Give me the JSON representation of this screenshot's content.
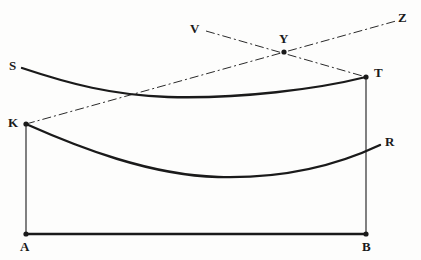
{
  "figure": {
    "type": "geometric-diagram",
    "background_color": "#fdfdfc",
    "stroke_color": "#1a1a1a",
    "width": 421,
    "height": 260,
    "labels": [
      {
        "id": "S",
        "text": "S",
        "x": 9,
        "y": 59,
        "name": "vertex-label-s"
      },
      {
        "id": "K",
        "text": "K",
        "x": 8,
        "y": 116,
        "name": "vertex-label-k"
      },
      {
        "id": "A",
        "text": "A",
        "x": 20,
        "y": 240,
        "name": "vertex-label-a"
      },
      {
        "id": "B",
        "text": "B",
        "x": 362,
        "y": 240,
        "name": "vertex-label-b"
      },
      {
        "id": "T",
        "text": "T",
        "x": 374,
        "y": 66,
        "name": "vertex-label-t"
      },
      {
        "id": "R",
        "text": "R",
        "x": 385,
        "y": 135,
        "name": "vertex-label-r"
      },
      {
        "id": "V",
        "text": "V",
        "x": 190,
        "y": 22,
        "name": "vertex-label-v"
      },
      {
        "id": "Y",
        "text": "Y",
        "x": 279,
        "y": 32,
        "name": "vertex-label-y"
      },
      {
        "id": "Z",
        "text": "Z",
        "x": 398,
        "y": 11,
        "name": "vertex-label-z"
      }
    ],
    "points": [
      {
        "id": "A",
        "x": 26,
        "y": 234
      },
      {
        "id": "B",
        "x": 366,
        "y": 234
      },
      {
        "id": "K",
        "x": 26,
        "y": 124
      },
      {
        "id": "T",
        "x": 366,
        "y": 77
      },
      {
        "id": "Y",
        "x": 284,
        "y": 52
      }
    ],
    "segments": [
      {
        "id": "AB",
        "name": "segment-ab",
        "from": "A",
        "to": "B",
        "style": "solid",
        "width": 2.4
      },
      {
        "id": "AK",
        "name": "segment-ak",
        "from": "A",
        "to": "K",
        "style": "solid",
        "width": 1.1
      },
      {
        "id": "BT",
        "name": "segment-bt",
        "from": "B",
        "to": "T",
        "style": "solid",
        "width": 1.1
      }
    ],
    "curves": [
      {
        "id": "ST",
        "name": "curve-st",
        "from": "S",
        "to": "T",
        "style": "solid",
        "width": 2.3,
        "path": "M 22 68 C 70 84, 112 95, 168 97 C 240 99, 318 89, 366 77"
      },
      {
        "id": "KR",
        "name": "curve-kr",
        "from": "K",
        "to": "R",
        "style": "solid",
        "width": 2.4,
        "path": "M 26 124 C 80 148, 150 175, 218 177 C 290 179, 344 162, 380 145"
      }
    ],
    "dash_dot_lines": [
      {
        "id": "KZ",
        "name": "line-kz",
        "x1": 26,
        "y1": 124,
        "x2": 396,
        "y2": 21
      },
      {
        "id": "VT",
        "name": "line-vt",
        "x1": 206,
        "y1": 31,
        "x2": 366,
        "y2": 77
      }
    ]
  }
}
